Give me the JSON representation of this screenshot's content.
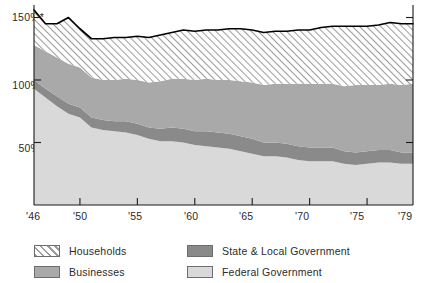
{
  "chart_data": {
    "type": "area",
    "stacked": true,
    "title": "",
    "subtitle": "",
    "xlabel": "",
    "ylabel": "",
    "grid": false,
    "legend_position": "bottom",
    "xlim": [
      1946,
      1979
    ],
    "ylim": [
      0,
      160
    ],
    "yticks": [
      50,
      100,
      150
    ],
    "ytick_labels": [
      "50%",
      "100%",
      "150%*"
    ],
    "xticks": [
      1946,
      1950,
      1955,
      1960,
      1965,
      1970,
      1975,
      1979
    ],
    "xtick_labels": [
      "'46",
      "'50",
      "'55",
      "'60",
      "'65",
      "'70",
      "'75",
      "'79"
    ],
    "x": [
      1946,
      1947,
      1948,
      1949,
      1950,
      1951,
      1952,
      1953,
      1954,
      1955,
      1956,
      1957,
      1958,
      1959,
      1960,
      1961,
      1962,
      1963,
      1964,
      1965,
      1966,
      1967,
      1968,
      1969,
      1970,
      1971,
      1972,
      1973,
      1974,
      1975,
      1976,
      1977,
      1978,
      1979
    ],
    "series": [
      {
        "name": "Federal Government",
        "color": "#d9d9d9",
        "values": [
          93,
          86,
          79,
          73,
          70,
          62,
          60,
          59,
          58,
          56,
          53,
          51,
          51,
          50,
          48,
          47,
          46,
          45,
          43,
          41,
          39,
          39,
          38,
          36,
          35,
          35,
          35,
          33,
          32,
          33,
          34,
          34,
          33,
          33
        ]
      },
      {
        "name": "State & Local Government",
        "color": "#8a8a8a",
        "values": [
          7,
          7,
          8,
          8,
          8,
          8,
          8,
          8,
          9,
          9,
          9,
          10,
          11,
          11,
          11,
          12,
          12,
          12,
          12,
          12,
          11,
          11,
          11,
          11,
          11,
          11,
          11,
          10,
          10,
          10,
          10,
          10,
          9,
          9
        ]
      },
      {
        "name": "Businesses",
        "color": "#a9a9a9",
        "values": [
          28,
          30,
          31,
          32,
          32,
          32,
          32,
          33,
          34,
          35,
          36,
          38,
          39,
          40,
          41,
          42,
          42,
          43,
          44,
          45,
          46,
          47,
          48,
          50,
          51,
          51,
          51,
          52,
          54,
          53,
          52,
          53,
          54,
          55
        ]
      },
      {
        "name": "Households",
        "color": "#ffffff",
        "pattern": "diagonal-hatch",
        "values": [
          28,
          22,
          27,
          37,
          31,
          31,
          33,
          34,
          33,
          35,
          36,
          37,
          37,
          39,
          39,
          39,
          40,
          41,
          42,
          42,
          42,
          42,
          42,
          43,
          43,
          45,
          46,
          48,
          47,
          47,
          48,
          49,
          49,
          48
        ]
      }
    ],
    "total_line": {
      "name": "Total",
      "color": "#000000",
      "values": [
        156,
        145,
        145,
        150,
        141,
        133,
        133,
        134,
        134,
        135,
        134,
        136,
        138,
        140,
        139,
        140,
        140,
        141,
        141,
        140,
        138,
        139,
        139,
        140,
        140,
        142,
        143,
        143,
        143,
        143,
        144,
        146,
        145,
        145
      ]
    },
    "footnote_marker": "*"
  },
  "legend": {
    "items": [
      {
        "label": "Households",
        "swatch": "hatch-swatch"
      },
      {
        "label": "Businesses",
        "swatch": "businesses-swatch"
      },
      {
        "label": "State & Local Government",
        "swatch": "state-local-swatch"
      },
      {
        "label": "Federal Government",
        "swatch": "federal-swatch"
      }
    ]
  }
}
